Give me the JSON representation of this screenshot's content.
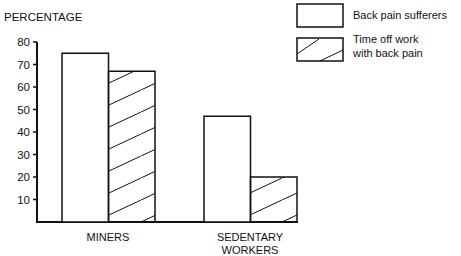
{
  "chart_data": {
    "type": "bar",
    "title": "",
    "ylabel": "PERCENTAGE",
    "xlabel": "",
    "ylim": [
      0,
      80
    ],
    "yticks": [
      10,
      20,
      30,
      40,
      50,
      60,
      70,
      80
    ],
    "grid": false,
    "legend_position": "top-right",
    "categories": [
      "MINERS",
      "SEDENTARY WORKERS"
    ],
    "category_lines": [
      [
        "MINERS"
      ],
      [
        "SEDENTARY",
        "WORKERS"
      ]
    ],
    "series": [
      {
        "name": "Back pain sufferers",
        "pattern": "plain",
        "values": [
          75,
          47
        ]
      },
      {
        "name": "Time off work with back pain",
        "pattern": "hatched",
        "values": [
          67,
          20
        ]
      }
    ],
    "legend": [
      {
        "lines": [
          "Back pain sufferers"
        ],
        "pattern": "plain"
      },
      {
        "lines": [
          "Time off work",
          "with back pain"
        ],
        "pattern": "hatched"
      }
    ]
  },
  "colors": {
    "ink": "#111111",
    "background": "#ffffff"
  }
}
